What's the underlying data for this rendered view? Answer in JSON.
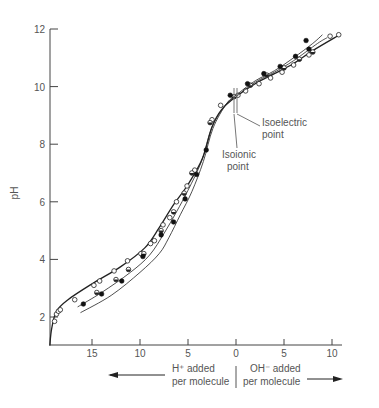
{
  "chart_data": {
    "type": "line",
    "title": "",
    "ylabel": "pH",
    "xlabel_left": [
      "H⁺ added",
      "per molecule"
    ],
    "xlabel_right": [
      "OH⁻ added",
      "per molecule"
    ],
    "x_direction_note": "Left of 0 = H+ added per molecule; right of 0 = OH- added per molecule (plotted as signed value, H+ negative)",
    "xlim": [
      -19.4,
      10.8
    ],
    "ylim": [
      1,
      12
    ],
    "xticks": [
      -15,
      -10,
      -5,
      0,
      5,
      10
    ],
    "xtick_labels": [
      "15",
      "10",
      "5",
      "0",
      "5",
      "10"
    ],
    "yticks": [
      2,
      4,
      6,
      8,
      10,
      12
    ],
    "ytick_labels": [
      "2",
      "4",
      "6",
      "8",
      "10",
      "12"
    ],
    "grid": false,
    "legend": "none",
    "annotations": [
      {
        "text": [
          "Isoelectric",
          "point"
        ],
        "x": -0.3,
        "y": 9.7
      },
      {
        "text": [
          "Isoionic",
          "point"
        ],
        "x": -0.7,
        "y": 9.6
      }
    ],
    "series": [
      {
        "name": "open circles (low ionic strength)",
        "marker": "open",
        "curve": [
          [
            -19.4,
            1.0
          ],
          [
            -19.2,
            1.6
          ],
          [
            -18.7,
            2.2
          ],
          [
            -17.5,
            2.6
          ],
          [
            -15,
            3.15
          ],
          [
            -12,
            3.75
          ],
          [
            -9.5,
            4.4
          ],
          [
            -8,
            5.1
          ],
          [
            -6.5,
            5.9
          ],
          [
            -5,
            6.6
          ],
          [
            -3.5,
            7.5
          ],
          [
            -2.5,
            8.6
          ],
          [
            -1.5,
            9.2
          ],
          [
            0,
            9.65
          ],
          [
            2,
            10.1
          ],
          [
            4,
            10.45
          ],
          [
            6,
            10.8
          ],
          [
            8,
            11.25
          ],
          [
            10.8,
            11.8
          ]
        ],
        "points": [
          [
            -18.9,
            1.85
          ],
          [
            -18.7,
            2.1
          ],
          [
            -18.5,
            2.2
          ],
          [
            -18.3,
            2.25
          ],
          [
            -16.8,
            2.6
          ],
          [
            -14.8,
            3.1
          ],
          [
            -14.2,
            3.25
          ],
          [
            -12.7,
            3.6
          ],
          [
            -11.3,
            3.95
          ],
          [
            -9.9,
            4.2
          ],
          [
            -8.9,
            4.55
          ],
          [
            -8.5,
            4.65
          ],
          [
            -7.6,
            5.2
          ],
          [
            -6.9,
            5.45
          ],
          [
            -6.2,
            6.0
          ],
          [
            -5.1,
            6.55
          ],
          [
            -4.3,
            7.1
          ],
          [
            -2.5,
            8.85
          ],
          [
            -1.6,
            9.35
          ],
          [
            0.2,
            9.7
          ],
          [
            1,
            9.85
          ],
          [
            2.4,
            10.1
          ],
          [
            3.6,
            10.3
          ],
          [
            4.8,
            10.5
          ],
          [
            6,
            10.75
          ],
          [
            7.6,
            11.1
          ],
          [
            9.8,
            11.75
          ],
          [
            10.7,
            11.8
          ]
        ]
      },
      {
        "name": "half-filled circles (medium ionic strength)",
        "marker": "half",
        "curve": [
          [
            -16.5,
            2.35
          ],
          [
            -14,
            2.85
          ],
          [
            -11,
            3.55
          ],
          [
            -9,
            4.15
          ],
          [
            -7.5,
            4.9
          ],
          [
            -6.2,
            5.65
          ],
          [
            -5,
            6.4
          ],
          [
            -3.6,
            7.4
          ],
          [
            -2.5,
            8.6
          ],
          [
            -1,
            9.4
          ],
          [
            0,
            9.65
          ],
          [
            2,
            10.15
          ],
          [
            4,
            10.5
          ],
          [
            6,
            10.9
          ],
          [
            8.5,
            11.5
          ],
          [
            9.5,
            11.7
          ]
        ],
        "points": [
          [
            -14.5,
            2.85
          ],
          [
            -12.5,
            3.3
          ],
          [
            -11.2,
            3.65
          ],
          [
            -9.6,
            4.2
          ],
          [
            -7.8,
            5.0
          ],
          [
            -6.5,
            5.65
          ],
          [
            -5.4,
            6.3
          ],
          [
            -4.6,
            7.0
          ],
          [
            -2.7,
            8.75
          ],
          [
            -0.2,
            9.65
          ],
          [
            1.5,
            10.05
          ],
          [
            3.2,
            10.4
          ],
          [
            5,
            10.65
          ],
          [
            6.6,
            10.95
          ],
          [
            8,
            11.2
          ]
        ]
      },
      {
        "name": "filled circles (high ionic strength)",
        "marker": "filled",
        "curve": [
          [
            -16.2,
            2.15
          ],
          [
            -13,
            2.75
          ],
          [
            -10,
            3.55
          ],
          [
            -8,
            4.2
          ],
          [
            -7,
            4.75
          ],
          [
            -5.8,
            5.55
          ],
          [
            -4.6,
            6.35
          ],
          [
            -3.4,
            7.4
          ],
          [
            -2.4,
            8.55
          ],
          [
            -1,
            9.4
          ],
          [
            0,
            9.7
          ],
          [
            2,
            10.2
          ],
          [
            4,
            10.55
          ],
          [
            6,
            11.0
          ],
          [
            8,
            11.5
          ],
          [
            9,
            11.8
          ]
        ],
        "points": [
          [
            -15.9,
            2.45
          ],
          [
            -14,
            2.8
          ],
          [
            -11.9,
            3.25
          ],
          [
            -9.7,
            4.1
          ],
          [
            -7.8,
            4.85
          ],
          [
            -6.5,
            5.3
          ],
          [
            -5.3,
            6.1
          ],
          [
            -4.1,
            6.95
          ],
          [
            -3.1,
            7.8
          ],
          [
            -0.6,
            9.7
          ],
          [
            1.2,
            10.1
          ],
          [
            2.9,
            10.45
          ],
          [
            4.6,
            10.7
          ],
          [
            6.2,
            11.05
          ],
          [
            7.6,
            11.3
          ],
          [
            7.3,
            11.6
          ]
        ]
      }
    ]
  }
}
